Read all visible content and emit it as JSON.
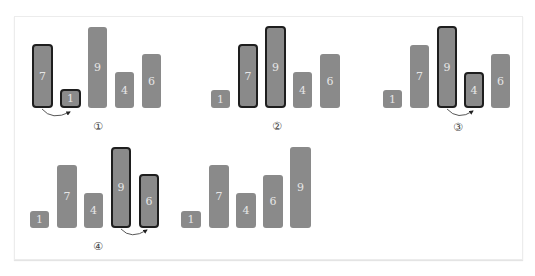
{
  "diagram": {
    "colors": {
      "bar_fill": "#8a8a8a",
      "highlight_border": "#1e1e1e",
      "number_text": "#e6e6e6",
      "frame_border": "#ececec"
    },
    "steps": [
      {
        "label": "①",
        "values": [
          "7",
          "1",
          "9",
          "4",
          "6"
        ],
        "highlighted": [
          0,
          1
        ],
        "swap_arrow": true
      },
      {
        "label": "②",
        "values": [
          "1",
          "7",
          "9",
          "4",
          "6"
        ],
        "highlighted": [
          1,
          2
        ],
        "swap_arrow": false
      },
      {
        "label": "③",
        "values": [
          "1",
          "7",
          "9",
          "4",
          "6"
        ],
        "highlighted": [
          2,
          3
        ],
        "swap_arrow": true
      },
      {
        "label": "④",
        "values": [
          "1",
          "7",
          "4",
          "9",
          "6"
        ],
        "highlighted": [
          3,
          4
        ],
        "swap_arrow": true
      },
      {
        "label": "",
        "values": [
          "1",
          "7",
          "4",
          "6",
          "9"
        ],
        "highlighted": [],
        "swap_arrow": false
      }
    ]
  }
}
